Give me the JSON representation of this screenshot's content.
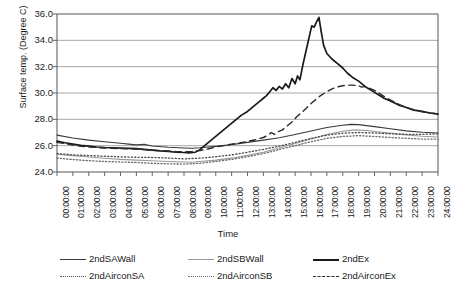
{
  "chart_data": {
    "type": "line",
    "title": "",
    "xlabel": "Time",
    "ylabel": "Surface temp. (Degree C)",
    "ylim": [
      24.0,
      36.0
    ],
    "ytick_labels": [
      "36.0",
      "34.0",
      "32.0",
      "30.0",
      "28.0",
      "26.0",
      "24.0"
    ],
    "ytick_values": [
      36.0,
      34.0,
      32.0,
      30.0,
      28.0,
      26.0,
      24.0
    ],
    "grid": "horizontal",
    "legend_position": "bottom",
    "x": [
      "00:00:00",
      "01:00:00",
      "02:00:00",
      "03:00:00",
      "04:00:00",
      "05:00:00",
      "06:00:00",
      "07:00:00",
      "08:00:00",
      "09:00:00",
      "10:00:00",
      "11:00:00",
      "12:00:00",
      "13:00:00",
      "14:00:00",
      "15:00:00",
      "16:00:00",
      "17:00:00",
      "18:00:00",
      "19:00:00",
      "20:00:00",
      "21:00:00",
      "22:00:00",
      "23:00:00",
      "24:00:00"
    ],
    "series": [
      {
        "name": "2ndSAWall",
        "style": "solid",
        "color": "#3a3a3a",
        "width": 1.1,
        "values": [
          26.8,
          26.6,
          26.4,
          26.3,
          26.15,
          26.05,
          25.95,
          25.85,
          25.8,
          25.85,
          25.95,
          26.1,
          26.25,
          26.4,
          26.6,
          26.85,
          27.1,
          27.35,
          27.55,
          27.6,
          27.45,
          27.25,
          27.1,
          27.0,
          26.95
        ]
      },
      {
        "name": "2ndSBWall",
        "style": "solid",
        "color": "#9a9a9a",
        "width": 1.1,
        "values": [
          25.35,
          25.25,
          25.15,
          25.05,
          24.95,
          24.9,
          24.85,
          24.8,
          24.75,
          24.8,
          24.9,
          25.05,
          25.25,
          25.5,
          25.8,
          26.15,
          26.5,
          26.85,
          27.1,
          27.2,
          27.1,
          26.95,
          26.8,
          26.7,
          26.65
        ]
      },
      {
        "name": "2ndEx",
        "style": "solid",
        "color": "#1a1a1a",
        "width": 1.7,
        "values": [
          26.35,
          26.15,
          26.0,
          25.9,
          25.85,
          25.8,
          25.7,
          25.6,
          25.55,
          25.7,
          26.3,
          27.3,
          28.3,
          29.5,
          30.4,
          31.2,
          35.7,
          33.0,
          31.8,
          30.9,
          30.1,
          29.5,
          29.0,
          28.65,
          28.4
        ]
      },
      {
        "name": "2ndAirconSA",
        "style": "dotted",
        "color": "#4a4a4a",
        "width": 1.3,
        "values": [
          25.4,
          25.3,
          25.25,
          25.2,
          25.15,
          25.1,
          25.1,
          25.05,
          25.0,
          25.05,
          25.15,
          25.3,
          25.5,
          25.7,
          25.95,
          26.25,
          26.55,
          26.8,
          26.95,
          27.0,
          26.95,
          26.9,
          26.85,
          26.85,
          26.9
        ]
      },
      {
        "name": "2ndAirconSB",
        "style": "dashdot",
        "color": "#6a6a6a",
        "width": 1.3,
        "values": [
          25.05,
          24.95,
          24.85,
          24.8,
          24.75,
          24.7,
          24.65,
          24.6,
          24.6,
          24.65,
          24.8,
          24.95,
          25.15,
          25.4,
          25.7,
          26.0,
          26.3,
          26.55,
          26.7,
          26.75,
          26.7,
          26.6,
          26.55,
          26.5,
          26.5
        ]
      },
      {
        "name": "2ndAirconEx",
        "style": "dashed",
        "color": "#2a2a2a",
        "width": 1.4,
        "values": [
          26.25,
          26.1,
          25.95,
          25.85,
          25.8,
          25.75,
          25.7,
          25.65,
          25.6,
          25.7,
          25.9,
          26.1,
          26.3,
          26.6,
          27.0,
          27.6,
          28.6,
          29.5,
          30.3,
          30.6,
          30.5,
          30.0,
          29.4,
          28.9,
          28.45
        ]
      }
    ],
    "detail_traces": {
      "2ndEx": [
        [
          0.0,
          26.35
        ],
        [
          0.5,
          26.22
        ],
        [
          1.0,
          26.12
        ],
        [
          1.5,
          26.02
        ],
        [
          2.0,
          25.96
        ],
        [
          2.5,
          25.9
        ],
        [
          3.0,
          25.86
        ],
        [
          3.5,
          25.84
        ],
        [
          4.0,
          25.82
        ],
        [
          4.5,
          25.8
        ],
        [
          5.0,
          25.78
        ],
        [
          5.5,
          25.72
        ],
        [
          6.0,
          25.66
        ],
        [
          6.5,
          25.6
        ],
        [
          7.0,
          25.56
        ],
        [
          7.5,
          25.5
        ],
        [
          8.0,
          25.48
        ],
        [
          8.3,
          25.45
        ],
        [
          8.7,
          25.5
        ],
        [
          9.0,
          25.7
        ],
        [
          9.3,
          26.0
        ],
        [
          9.6,
          26.3
        ],
        [
          10.0,
          26.7
        ],
        [
          10.4,
          27.1
        ],
        [
          10.8,
          27.5
        ],
        [
          11.2,
          27.9
        ],
        [
          11.6,
          28.3
        ],
        [
          12.0,
          28.6
        ],
        [
          12.4,
          29.0
        ],
        [
          12.8,
          29.4
        ],
        [
          13.0,
          29.6
        ],
        [
          13.2,
          29.8
        ],
        [
          13.4,
          30.1
        ],
        [
          13.6,
          30.4
        ],
        [
          13.8,
          30.2
        ],
        [
          14.0,
          30.5
        ],
        [
          14.2,
          30.3
        ],
        [
          14.4,
          30.7
        ],
        [
          14.6,
          30.4
        ],
        [
          14.8,
          31.1
        ],
        [
          15.0,
          30.7
        ],
        [
          15.15,
          31.3
        ],
        [
          15.3,
          31.0
        ],
        [
          15.5,
          32.2
        ],
        [
          15.65,
          33.0
        ],
        [
          15.8,
          33.8
        ],
        [
          15.95,
          34.6
        ],
        [
          16.05,
          35.1
        ],
        [
          16.2,
          35.0
        ],
        [
          16.35,
          35.4
        ],
        [
          16.5,
          35.75
        ],
        [
          16.65,
          34.6
        ],
        [
          16.8,
          33.6
        ],
        [
          17.0,
          33.0
        ],
        [
          17.3,
          32.6
        ],
        [
          17.6,
          32.3
        ],
        [
          18.0,
          31.9
        ],
        [
          18.3,
          31.5
        ],
        [
          18.6,
          31.2
        ],
        [
          19.0,
          30.9
        ],
        [
          19.4,
          30.5
        ],
        [
          19.8,
          30.2
        ],
        [
          20.2,
          29.9
        ],
        [
          20.6,
          29.6
        ],
        [
          21.0,
          29.4
        ],
        [
          21.5,
          29.1
        ],
        [
          22.0,
          28.9
        ],
        [
          22.5,
          28.7
        ],
        [
          23.0,
          28.6
        ],
        [
          23.5,
          28.48
        ],
        [
          24.0,
          28.4
        ]
      ],
      "2ndAirconEx": [
        [
          0.0,
          26.25
        ],
        [
          0.5,
          26.15
        ],
        [
          1.0,
          26.05
        ],
        [
          1.5,
          25.96
        ],
        [
          2.0,
          25.9
        ],
        [
          2.5,
          25.86
        ],
        [
          3.0,
          25.82
        ],
        [
          3.5,
          25.8
        ],
        [
          4.0,
          25.78
        ],
        [
          4.5,
          25.76
        ],
        [
          5.0,
          25.74
        ],
        [
          5.5,
          25.7
        ],
        [
          6.0,
          25.66
        ],
        [
          6.5,
          25.62
        ],
        [
          7.0,
          25.6
        ],
        [
          7.5,
          25.56
        ],
        [
          8.0,
          25.54
        ],
        [
          8.5,
          25.55
        ],
        [
          9.0,
          25.62
        ],
        [
          9.5,
          25.75
        ],
        [
          10.0,
          25.9
        ],
        [
          10.5,
          26.0
        ],
        [
          11.0,
          26.12
        ],
        [
          11.5,
          26.2
        ],
        [
          12.0,
          26.32
        ],
        [
          12.5,
          26.45
        ],
        [
          13.0,
          26.62
        ],
        [
          13.3,
          26.8
        ],
        [
          13.5,
          27.0
        ],
        [
          13.7,
          26.85
        ],
        [
          13.9,
          27.05
        ],
        [
          14.2,
          27.2
        ],
        [
          14.5,
          27.5
        ],
        [
          14.8,
          27.8
        ],
        [
          15.1,
          28.2
        ],
        [
          15.4,
          28.5
        ],
        [
          15.7,
          28.85
        ],
        [
          16.0,
          29.2
        ],
        [
          16.3,
          29.5
        ],
        [
          16.6,
          29.8
        ],
        [
          17.0,
          30.1
        ],
        [
          17.3,
          30.3
        ],
        [
          17.6,
          30.45
        ],
        [
          18.0,
          30.55
        ],
        [
          18.3,
          30.6
        ],
        [
          18.6,
          30.6
        ],
        [
          19.0,
          30.55
        ],
        [
          19.2,
          30.45
        ],
        [
          19.4,
          30.5
        ],
        [
          19.7,
          30.35
        ],
        [
          20.0,
          30.2
        ],
        [
          20.4,
          29.9
        ],
        [
          20.8,
          29.6
        ],
        [
          21.2,
          29.35
        ],
        [
          21.6,
          29.1
        ],
        [
          22.0,
          28.9
        ],
        [
          22.5,
          28.7
        ],
        [
          23.0,
          28.58
        ],
        [
          23.5,
          28.48
        ],
        [
          24.0,
          28.42
        ]
      ],
      "2ndSAWall": [
        [
          0.0,
          26.8
        ],
        [
          1.0,
          26.58
        ],
        [
          2.0,
          26.42
        ],
        [
          3.0,
          26.3
        ],
        [
          4.0,
          26.18
        ],
        [
          4.5,
          26.12
        ],
        [
          5.0,
          26.06
        ],
        [
          5.5,
          26.1
        ],
        [
          6.0,
          25.98
        ],
        [
          7.0,
          25.88
        ],
        [
          8.0,
          25.82
        ],
        [
          8.5,
          25.8
        ],
        [
          9.0,
          25.84
        ],
        [
          10.0,
          25.95
        ],
        [
          11.0,
          26.08
        ],
        [
          12.0,
          26.25
        ],
        [
          13.0,
          26.42
        ],
        [
          14.0,
          26.6
        ],
        [
          15.0,
          26.85
        ],
        [
          16.0,
          27.12
        ],
        [
          17.0,
          27.38
        ],
        [
          18.0,
          27.55
        ],
        [
          18.5,
          27.62
        ],
        [
          19.0,
          27.6
        ],
        [
          20.0,
          27.45
        ],
        [
          21.0,
          27.28
        ],
        [
          22.0,
          27.12
        ],
        [
          23.0,
          27.02
        ],
        [
          24.0,
          26.96
        ]
      ],
      "2ndSBWall": [
        [
          0.0,
          25.35
        ],
        [
          1.0,
          25.24
        ],
        [
          2.0,
          25.14
        ],
        [
          3.0,
          25.04
        ],
        [
          4.0,
          24.96
        ],
        [
          5.0,
          24.9
        ],
        [
          6.0,
          24.85
        ],
        [
          7.0,
          24.8
        ],
        [
          8.0,
          24.76
        ],
        [
          8.5,
          24.74
        ],
        [
          9.0,
          24.8
        ],
        [
          10.0,
          24.9
        ],
        [
          11.0,
          25.05
        ],
        [
          12.0,
          25.26
        ],
        [
          13.0,
          25.5
        ],
        [
          14.0,
          25.82
        ],
        [
          15.0,
          26.16
        ],
        [
          16.0,
          26.5
        ],
        [
          17.0,
          26.85
        ],
        [
          18.0,
          27.1
        ],
        [
          18.8,
          27.2
        ],
        [
          19.5,
          27.15
        ],
        [
          20.0,
          27.08
        ],
        [
          21.0,
          26.95
        ],
        [
          22.0,
          26.82
        ],
        [
          23.0,
          26.72
        ],
        [
          24.0,
          26.66
        ]
      ],
      "2ndAirconSA": [
        [
          0.0,
          25.4
        ],
        [
          1.0,
          25.3
        ],
        [
          2.0,
          25.25
        ],
        [
          3.0,
          25.2
        ],
        [
          4.0,
          25.15
        ],
        [
          5.0,
          25.12
        ],
        [
          6.0,
          25.1
        ],
        [
          7.0,
          25.06
        ],
        [
          8.0,
          25.0
        ],
        [
          9.0,
          25.05
        ],
        [
          10.0,
          25.16
        ],
        [
          11.0,
          25.3
        ],
        [
          12.0,
          25.5
        ],
        [
          13.0,
          25.72
        ],
        [
          14.0,
          25.96
        ],
        [
          15.0,
          26.25
        ],
        [
          16.0,
          26.55
        ],
        [
          17.0,
          26.8
        ],
        [
          18.0,
          26.95
        ],
        [
          19.0,
          27.0
        ],
        [
          20.0,
          26.96
        ],
        [
          21.0,
          26.9
        ],
        [
          22.0,
          26.86
        ],
        [
          23.0,
          26.86
        ],
        [
          24.0,
          26.9
        ]
      ],
      "2ndAirconSB": [
        [
          0.0,
          25.05
        ],
        [
          1.0,
          24.95
        ],
        [
          2.0,
          24.86
        ],
        [
          3.0,
          24.8
        ],
        [
          4.0,
          24.76
        ],
        [
          5.0,
          24.72
        ],
        [
          6.0,
          24.66
        ],
        [
          7.0,
          24.62
        ],
        [
          8.0,
          24.6
        ],
        [
          9.0,
          24.66
        ],
        [
          10.0,
          24.8
        ],
        [
          11.0,
          24.96
        ],
        [
          12.0,
          25.16
        ],
        [
          13.0,
          25.4
        ],
        [
          14.0,
          25.7
        ],
        [
          15.0,
          26.0
        ],
        [
          16.0,
          26.3
        ],
        [
          17.0,
          26.56
        ],
        [
          18.0,
          26.7
        ],
        [
          19.0,
          26.76
        ],
        [
          20.0,
          26.7
        ],
        [
          21.0,
          26.62
        ],
        [
          22.0,
          26.56
        ],
        [
          23.0,
          26.5
        ],
        [
          24.0,
          26.5
        ]
      ]
    }
  },
  "axes": {
    "y_title": "Surface temp. (Degree C)",
    "x_title": "Time"
  },
  "legend": {
    "row1": [
      {
        "label": "2ndSAWall",
        "style": "solid",
        "color": "#3a3a3a"
      },
      {
        "label": "2ndSBWall",
        "style": "solid",
        "color": "#9a9a9a"
      },
      {
        "label": "2ndEx",
        "style": "solid-bold",
        "color": "#1a1a1a"
      }
    ],
    "row2": [
      {
        "label": "2ndAirconSA",
        "style": "dotted",
        "color": "#4a4a4a"
      },
      {
        "label": "2ndAirconSB",
        "style": "dashdot",
        "color": "#6a6a6a"
      },
      {
        "label": "2ndAirconEx",
        "style": "dashed",
        "color": "#2a2a2a"
      }
    ]
  },
  "colors": {
    "axis": "#555555",
    "grid": "#9d9d9d",
    "background": "#ffffff",
    "text": "#1a1a1a"
  }
}
